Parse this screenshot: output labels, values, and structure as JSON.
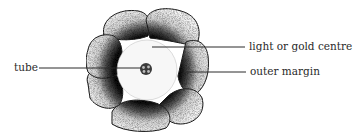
{
  "diagram": {
    "colors": {
      "background": "#ffffff",
      "ink": "#2a2a2a",
      "petal_light": "#f2f2f2",
      "petal_dark": "#111111",
      "centre": "#f7f7f7"
    },
    "labels": {
      "tube": "tube",
      "centre": "light or gold centre",
      "margin": "outer margin"
    },
    "flower": {
      "cx": 147,
      "cy": 70,
      "petal_count": 6,
      "centre_radius": 30,
      "tube_radius": 6
    }
  }
}
